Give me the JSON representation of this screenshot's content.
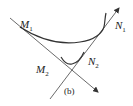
{
  "figure": {
    "caption": "(b)",
    "labels": {
      "m1": {
        "base": "M",
        "sub": "1"
      },
      "n1": {
        "base": "N",
        "sub": "1"
      },
      "m2": {
        "base": "M",
        "sub": "2"
      },
      "n2": {
        "base": "N",
        "sub": "2"
      }
    },
    "stroke_color": "#333333"
  }
}
